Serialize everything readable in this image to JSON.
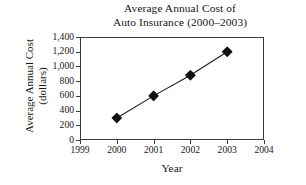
{
  "chart_data": {
    "type": "line",
    "title": "Average Annual Cost of Auto Insurance (2000–2003)",
    "title_lines": [
      "Average Annual Cost of",
      "Auto Insurance (2000–2003)"
    ],
    "xlabel": "Year",
    "ylabel": "Average Annual Cost (dollars)",
    "ylabel_lines": [
      "Average Annual Cost",
      "(dollars)"
    ],
    "x": [
      2000,
      2001,
      2002,
      2003
    ],
    "categories": [
      "2000",
      "2001",
      "2002",
      "2003"
    ],
    "values": [
      300,
      600,
      880,
      1200
    ],
    "series": [
      {
        "name": "Average Annual Cost",
        "values": [
          300,
          600,
          880,
          1200
        ]
      }
    ],
    "xlim": [
      1999,
      2004
    ],
    "ylim": [
      0,
      1400
    ],
    "xticks": [
      1999,
      2000,
      2001,
      2002,
      2003,
      2004
    ],
    "xtick_labels": [
      "1999",
      "2000",
      "2001",
      "2002",
      "2003",
      "2004"
    ],
    "yticks": [
      0,
      200,
      400,
      600,
      800,
      1000,
      1200,
      1400
    ],
    "ytick_labels": [
      "0",
      "200",
      "400",
      "600",
      "800",
      "1,000",
      "1,200",
      "1,400"
    ],
    "grid": false,
    "legend": false,
    "legend_position": "none",
    "marker": "diamond",
    "marker_color": "#111111",
    "line_color": "#1a1a1a",
    "frame_color": "#3b3b3b",
    "background": "#ffffff"
  }
}
